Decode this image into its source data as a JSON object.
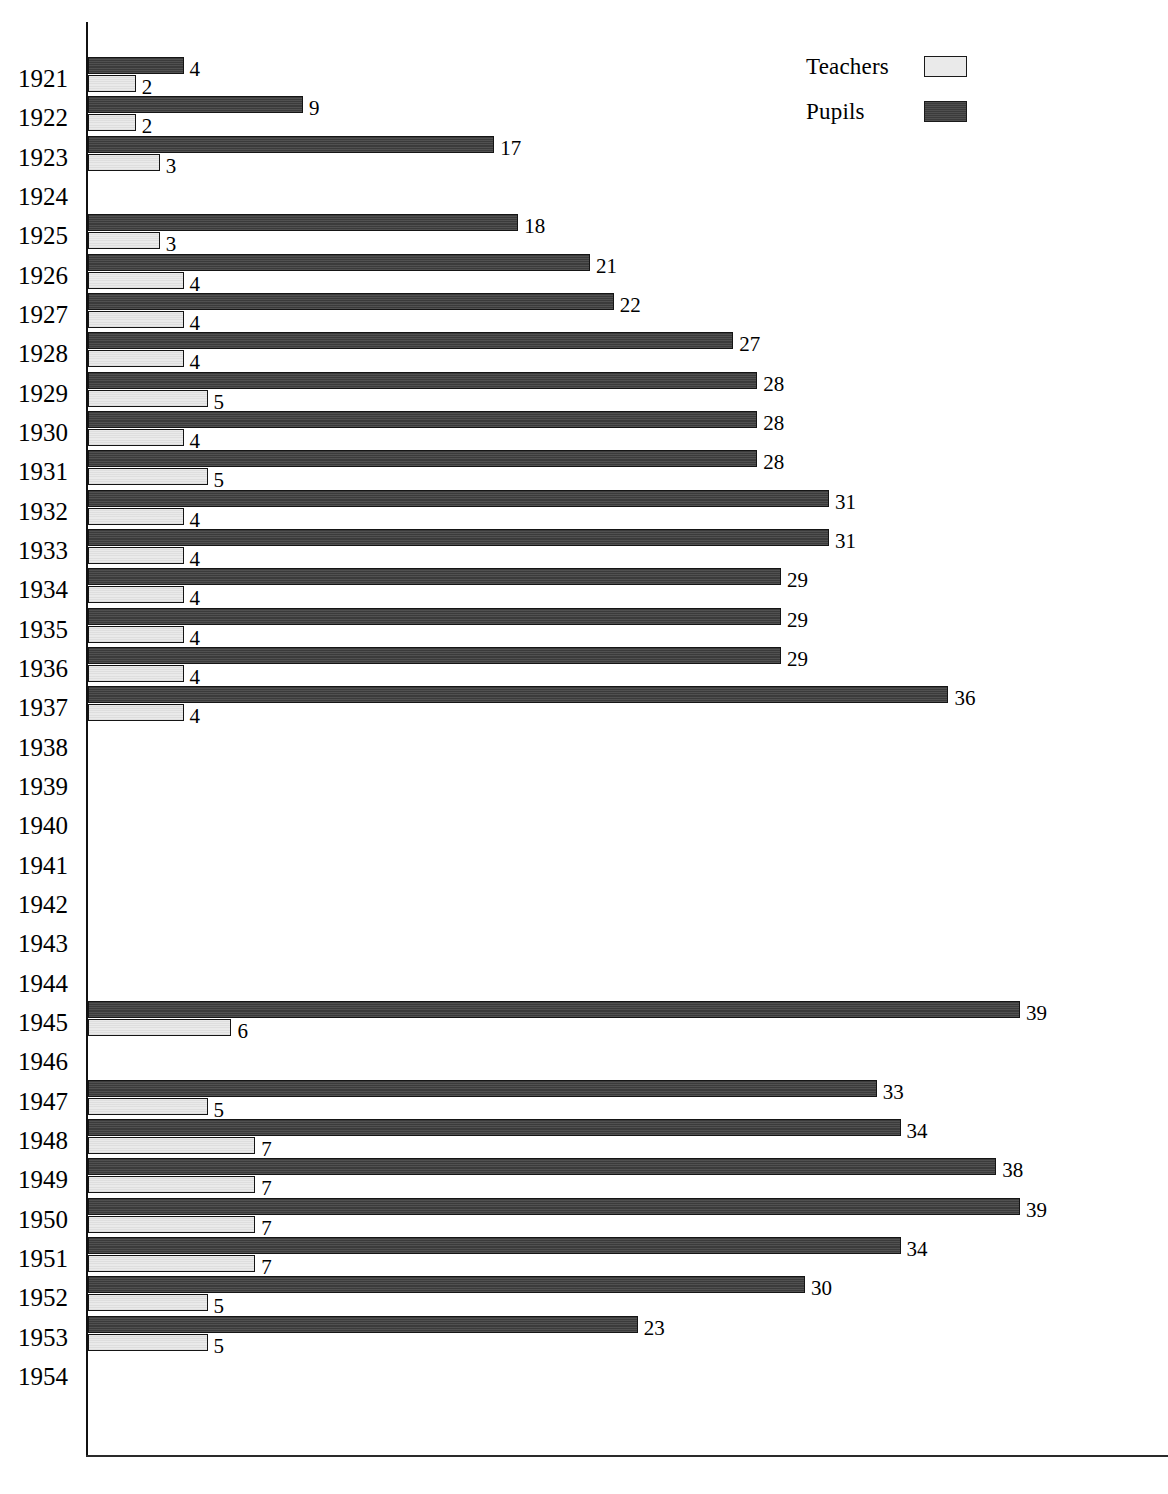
{
  "legend": {
    "position": "top-right",
    "entries": [
      {
        "label": "Teachers",
        "swatch": "light-gray",
        "color": "#eaeaea",
        "icon": "legend-swatch-icon"
      },
      {
        "label": "Pupils",
        "swatch": "dark-gray",
        "color": "#3b3b3b",
        "icon": "legend-swatch-icon"
      }
    ]
  },
  "colors": {
    "teachers": "#eaeaea",
    "pupils": "#3b3b3b",
    "axis": "#111111",
    "text": "#000000"
  },
  "chart_data": {
    "type": "bar",
    "orientation": "horizontal",
    "title": "",
    "subtitle": "",
    "xlabel": "",
    "ylabel": "",
    "grid": false,
    "legend_position": "top-right",
    "xlim": [
      0,
      45
    ],
    "categories": [
      "1921",
      "1922",
      "1923",
      "1924",
      "1925",
      "1926",
      "1927",
      "1928",
      "1929",
      "1930",
      "1931",
      "1932",
      "1933",
      "1934",
      "1935",
      "1936",
      "1937",
      "1938",
      "1939",
      "1940",
      "1941",
      "1942",
      "1943",
      "1944",
      "1945",
      "1946",
      "1947",
      "1948",
      "1949",
      "1950",
      "1951",
      "1952",
      "1953",
      "1954"
    ],
    "series": [
      {
        "name": "Pupils",
        "color": "#3b3b3b",
        "values": [
          4,
          9,
          17,
          null,
          18,
          21,
          22,
          27,
          28,
          28,
          28,
          31,
          31,
          29,
          29,
          29,
          36,
          null,
          null,
          null,
          null,
          null,
          null,
          null,
          39,
          null,
          33,
          34,
          38,
          39,
          34,
          30,
          23,
          null
        ]
      },
      {
        "name": "Teachers",
        "color": "#eaeaea",
        "values": [
          2,
          2,
          3,
          null,
          3,
          4,
          4,
          4,
          5,
          4,
          5,
          4,
          4,
          4,
          4,
          4,
          4,
          null,
          null,
          null,
          null,
          null,
          null,
          null,
          6,
          null,
          5,
          7,
          7,
          7,
          7,
          5,
          5,
          null
        ]
      }
    ],
    "data_labels_shown": true,
    "empty_years": [
      "1924",
      "1938",
      "1939",
      "1940",
      "1941",
      "1942",
      "1943",
      "1944",
      "1946",
      "1954"
    ]
  }
}
